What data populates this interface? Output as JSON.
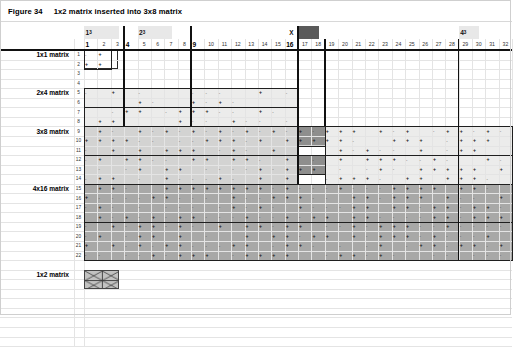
{
  "figure": {
    "number": "Figure 34",
    "caption": "1x2 matrix inserted into 3x8 matrix"
  },
  "header": {
    "power_labels": [
      {
        "text": "1",
        "sup": "3",
        "col": 1
      },
      {
        "text": "2",
        "sup": "3",
        "col": 5
      },
      {
        "text": "4",
        "sup": "3",
        "col": 29
      }
    ],
    "x_marker": {
      "label": "X",
      "col": 16
    },
    "dark_block": {
      "col": 17
    },
    "bold_columns": [
      "1",
      "4",
      "9",
      "16"
    ],
    "columns": [
      "1",
      "2",
      "3",
      "4",
      "5",
      "6",
      "7",
      "8",
      "9",
      "10",
      "11",
      "12",
      "13",
      "14",
      "15",
      "16",
      "17",
      "18",
      "19",
      "20",
      "21",
      "22",
      "23",
      "24",
      "25",
      "26",
      "27",
      "28",
      "29",
      "30",
      "31",
      "32"
    ]
  },
  "rows": {
    "numbers": [
      "1",
      "2",
      "3",
      "4",
      "5",
      "6",
      "7",
      "8",
      "9",
      "10",
      "11",
      "12",
      "13",
      "14",
      "15",
      "16",
      "17",
      "18",
      "19",
      "20",
      "21",
      "22"
    ],
    "labels": [
      {
        "text": "1x1 matrix",
        "row": 1
      },
      {
        "text": "2x4 matrix",
        "row": 5
      },
      {
        "text": "3x8 matrix",
        "row": 9
      },
      {
        "text": "4x16 matrix",
        "row": 15
      },
      {
        "text": "1x2 matrix",
        "row": 24
      }
    ]
  },
  "regions": [
    {
      "name": "1x1 matrix",
      "fill": "white",
      "rows": [
        1,
        2
      ],
      "cols": [
        1,
        4
      ]
    },
    {
      "name": "2x4 matrix",
      "fill": "light",
      "rows": [
        5,
        8
      ],
      "cols": [
        1,
        16
      ]
    },
    {
      "name": "3x8 matrix",
      "fill": "mid",
      "rows": [
        9,
        14
      ],
      "cols": [
        1,
        32
      ]
    },
    {
      "name": "inserted 1x2",
      "fill": "inserted",
      "rows": [
        9,
        14
      ],
      "cols": [
        17,
        18
      ]
    },
    {
      "name": "4x16 matrix",
      "fill": "dark",
      "rows": [
        15,
        22
      ],
      "cols": [
        1,
        32
      ]
    },
    {
      "name": "1x2 matrix key",
      "fill": "hatch",
      "rows": [
        24,
        25
      ],
      "cols": [
        1,
        4
      ]
    }
  ],
  "symbols": {
    "plus": "+",
    "minus": "-"
  },
  "colors": {
    "grid_line": "#e4e4e4",
    "region_border": "#1f1f1f",
    "fill_light": "#ececeb",
    "fill_mid": "#d3d3d2",
    "fill_dark": "#a8a8a7",
    "fill_inserted": "#8e8e8d",
    "header_highlight": "#e8e8e8",
    "dark_block": "#5a5a5a"
  }
}
